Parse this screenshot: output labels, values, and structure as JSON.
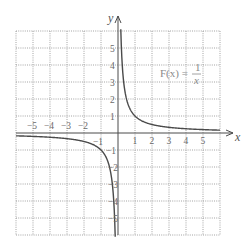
{
  "chart_data": {
    "type": "line",
    "title": "",
    "function_label": {
      "lhs": "F(x) =",
      "numerator": "1",
      "denominator": "x"
    },
    "xlabel": "x",
    "ylabel": "y",
    "xlim": [
      -6,
      6
    ],
    "ylim": [
      -6,
      6
    ],
    "grid": true,
    "grid_style": "dotted",
    "x_ticks": [
      -5,
      -4,
      -3,
      -2,
      -1,
      1,
      2,
      3,
      4,
      5
    ],
    "y_ticks": [
      5,
      4,
      3,
      2,
      1,
      -1,
      -2,
      -3,
      -4,
      -5
    ],
    "x_tick_labels": [
      "−5",
      "−4",
      "−3",
      "−2",
      "−1",
      "1",
      "2",
      "3",
      "4",
      "5"
    ],
    "y_tick_labels": [
      "5",
      "4",
      "3",
      "2",
      "1",
      "−1",
      "−2",
      "−3",
      "−4",
      "−5"
    ],
    "series": [
      {
        "name": "F(x) = 1/x (x > 0)",
        "x": [
          0.167,
          0.2,
          0.25,
          0.333,
          0.5,
          1,
          2,
          3,
          4,
          5,
          6
        ],
        "y": [
          6,
          5,
          4,
          3,
          2,
          1,
          0.5,
          0.333,
          0.25,
          0.2,
          0.167
        ]
      },
      {
        "name": "F(x) = 1/x (x < 0)",
        "x": [
          -6,
          -5,
          -4,
          -3,
          -2,
          -1,
          -0.5,
          -0.333,
          -0.25,
          -0.2,
          -0.167
        ],
        "y": [
          -0.167,
          -0.2,
          -0.25,
          -0.333,
          -0.5,
          -1,
          -2,
          -3,
          -4,
          -5,
          -6
        ]
      }
    ],
    "colors": {
      "curve": "#4a4a4a",
      "axes": "#4a4a4a",
      "grid": "#9a9a9a"
    }
  }
}
